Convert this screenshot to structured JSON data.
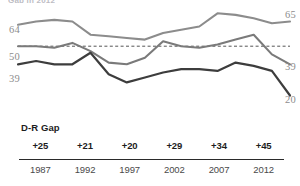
{
  "title_sliver": "Gap in 2012",
  "axis": {
    "left_labels": [
      {
        "value": "64",
        "y": 30
      },
      {
        "value": "50",
        "y": 57
      },
      {
        "value": "39",
        "y": 79
      }
    ],
    "right_labels": [
      {
        "value": "65",
        "y": 15
      },
      {
        "value": "39",
        "y": 67
      },
      {
        "value": "20",
        "y": 100
      }
    ]
  },
  "gap_section": {
    "label": "D-R Gap",
    "values": [
      "+25",
      "+21",
      "+20",
      "+29",
      "+34",
      "+45"
    ],
    "years": [
      "1987",
      "1992",
      "1997",
      "2002",
      "2007",
      "2012"
    ]
  },
  "colors": {
    "line_light": "#8c8c8c",
    "line_mid": "#7a7a7a",
    "line_dark": "#3d3d3d",
    "reference": "#555555",
    "text": "#3a3a3a",
    "axis_text": "#8d8d8d"
  },
  "chart_data": {
    "type": "line",
    "title": "Gap in 2012",
    "xlabel": "",
    "ylabel": "",
    "ylim": [
      10,
      72
    ],
    "grid": false,
    "legend": false,
    "reference_line": {
      "value": 50,
      "style": "dashed",
      "label": "50"
    },
    "x": [
      1987,
      1989,
      1991,
      1992,
      1993,
      1995,
      1997,
      1999,
      2000,
      2002,
      2003,
      2005,
      2007,
      2009,
      2011,
      2012
    ],
    "series": [
      {
        "name": "Democrat",
        "color": "#8c8c8c",
        "end_label": "65",
        "start_label": "64",
        "values": [
          63,
          65,
          66,
          65,
          57,
          56,
          55,
          54,
          58,
          60,
          62,
          70,
          69,
          67,
          64,
          65
        ]
      },
      {
        "name": "Independent",
        "color": "#7a7a7a",
        "end_label": "39",
        "start_label": "50",
        "values": [
          50,
          50,
          49,
          52,
          47,
          40,
          39,
          43,
          53,
          50,
          49,
          51,
          54,
          57,
          45,
          39
        ]
      },
      {
        "name": "Republican",
        "color": "#3d3d3d",
        "end_label": "20",
        "start_label": "39",
        "values": [
          39,
          41,
          39,
          39,
          46,
          33,
          28,
          31,
          34,
          36,
          36,
          35,
          40,
          38,
          35,
          20
        ]
      }
    ],
    "gap_label": "D-R Gap",
    "gap_years": [
      1987,
      1992,
      1997,
      2002,
      2007,
      2012
    ],
    "gap_values": [
      "+25",
      "+21",
      "+20",
      "+29",
      "+34",
      "+45"
    ]
  }
}
